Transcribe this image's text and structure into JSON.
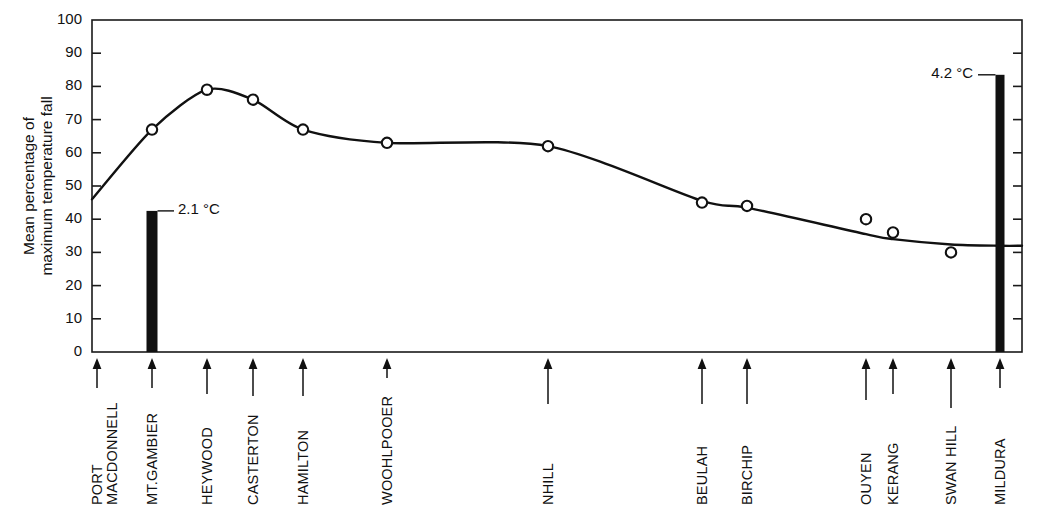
{
  "chart_data": {
    "type": "line",
    "title": "",
    "xlabel": "",
    "ylabel": "Mean percentage of\nmaximum temperature fall",
    "ylabel_line1": "Mean percentage of",
    "ylabel_line2": "maximum temperature fall",
    "ylim": [
      0,
      100
    ],
    "ytick_step": 10,
    "ytick_labels": [
      "0",
      "10",
      "20",
      "30",
      "40",
      "50",
      "60",
      "70",
      "80",
      "90",
      "100"
    ],
    "grid": false,
    "legend": "none",
    "categories": [
      "PORT MACDONNELL",
      "MT.GAMBIER",
      "HEYWOOD",
      "CASTERTON",
      "HAMILTON",
      "WOOHLPOOER",
      "NHILL",
      "BEULAH",
      "BIRCHIP",
      "OUYEN",
      "KERANG",
      "SWAN HILL",
      "MILDURA"
    ],
    "category_label_lines": [
      [
        "PORT",
        "MACDONNELL"
      ],
      [
        "MT.GAMBIER"
      ],
      [
        "HEYWOOD"
      ],
      [
        "CASTERTON"
      ],
      [
        "HAMILTON"
      ],
      [
        "WOOHLPOOER"
      ],
      [
        "NHILL"
      ],
      [
        "BEULAH"
      ],
      [
        "BIRCHIP"
      ],
      [
        "OUYEN"
      ],
      [
        "KERANG"
      ],
      [
        "SWAN HILL"
      ],
      [
        "MILDURA"
      ]
    ],
    "series": [
      {
        "name": "Mean percentage of maximum temperature fall",
        "marker": "open-circle",
        "values": [
          null,
          67,
          79,
          76,
          67,
          63,
          62,
          45,
          44,
          40,
          36,
          30,
          null
        ]
      }
    ],
    "curve_start_value": 46,
    "curve_end_value": 32,
    "bars": [
      {
        "category": "MT.GAMBIER",
        "value": 42.5,
        "label": "2.1 °C",
        "amount": "2.1",
        "unit": "°C",
        "label_side": "right"
      },
      {
        "category": "MILDURA",
        "value": 83.5,
        "label": "4.2 °C",
        "amount": "4.2",
        "unit": "°C",
        "label_side": "left"
      }
    ],
    "annotations": [
      {
        "text": "2.1 °C",
        "attached_to": "MT.GAMBIER"
      },
      {
        "text": "4.2 °C",
        "attached_to": "MILDURA"
      }
    ],
    "colors": {
      "line": "#111111",
      "marker_fill": "#ffffff",
      "bar": "#111111",
      "axis": "#1a1a1a",
      "background": "#ffffff"
    }
  }
}
